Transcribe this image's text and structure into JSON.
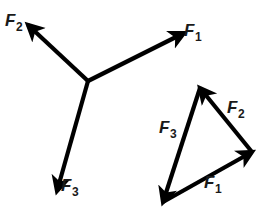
{
  "figure": {
    "background_color": "#ffffff",
    "stroke_color": "#000000",
    "label_color": "#1a1a1a",
    "width": 270,
    "height": 212
  },
  "concurrent_group": {
    "name": "concurrent-force-vectors",
    "origin": {
      "x": 88,
      "y": 81
    },
    "vectors": [
      {
        "id": "f1",
        "label_base": "F",
        "label_sub": "1",
        "from": {
          "x": 88,
          "y": 81
        },
        "to": {
          "x": 184,
          "y": 33
        },
        "label_pos": {
          "x": 184,
          "y": 22
        }
      },
      {
        "id": "f2",
        "label_base": "F",
        "label_sub": "2",
        "from": {
          "x": 88,
          "y": 81
        },
        "to": {
          "x": 28,
          "y": 25
        },
        "label_pos": {
          "x": 5,
          "y": 12
        }
      },
      {
        "id": "f3",
        "label_base": "F",
        "label_sub": "3",
        "from": {
          "x": 88,
          "y": 81
        },
        "to": {
          "x": 57,
          "y": 191
        },
        "label_pos": {
          "x": 61,
          "y": 177
        }
      }
    ]
  },
  "triangle_group": {
    "name": "closed-vector-triangle",
    "vertices": {
      "bottom_left": {
        "x": 163,
        "y": 202
      },
      "apex": {
        "x": 200,
        "y": 88
      },
      "right": {
        "x": 252,
        "y": 152
      }
    },
    "vectors": [
      {
        "id": "f1",
        "label_base": "F",
        "label_sub": "1",
        "from": {
          "x": 163,
          "y": 202
        },
        "to": {
          "x": 252,
          "y": 152
        },
        "label_pos": {
          "x": 204,
          "y": 174
        }
      },
      {
        "id": "f2",
        "label_base": "F",
        "label_sub": "2",
        "from": {
          "x": 252,
          "y": 152
        },
        "to": {
          "x": 200,
          "y": 88
        },
        "label_pos": {
          "x": 227,
          "y": 99
        }
      },
      {
        "id": "f3",
        "label_base": "F",
        "label_sub": "3",
        "from": {
          "x": 200,
          "y": 88
        },
        "to": {
          "x": 163,
          "y": 202
        },
        "label_pos": {
          "x": 159,
          "y": 119
        }
      }
    ]
  }
}
